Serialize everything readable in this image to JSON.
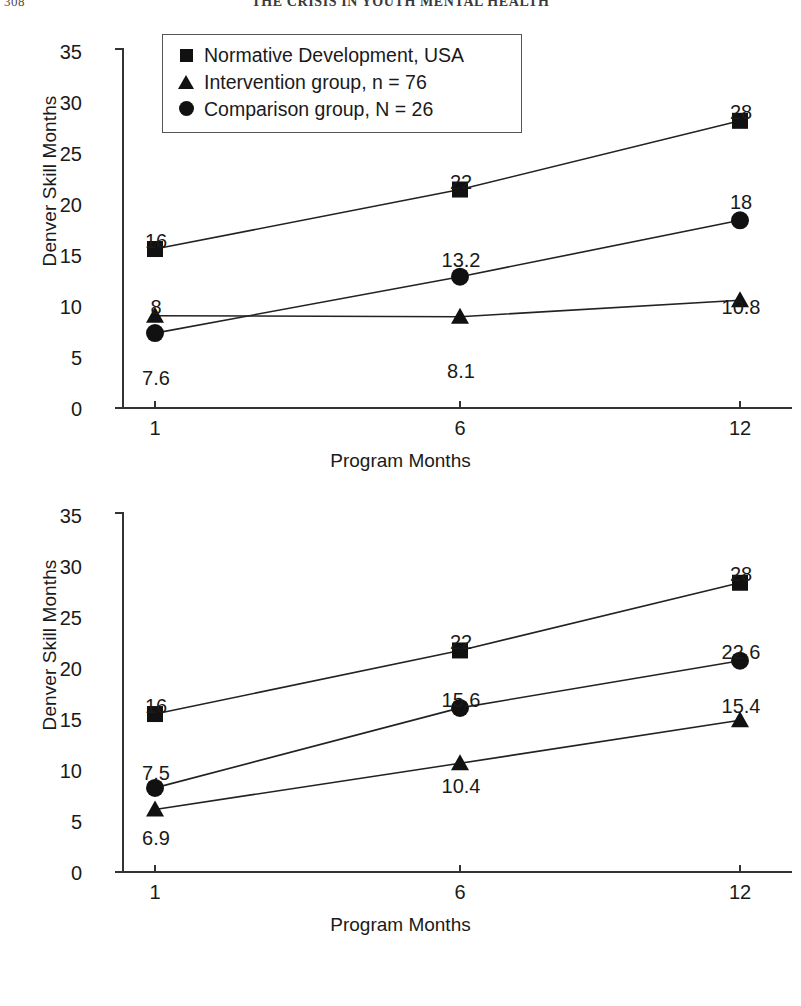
{
  "page": {
    "folio": "308",
    "running_head": "THE CRISIS IN YOUTH MENTAL HEALTH"
  },
  "legend": {
    "entries": [
      {
        "marker": "square",
        "label": "Normative Development, USA"
      },
      {
        "marker": "triangle",
        "label": "Intervention group, n = 76"
      },
      {
        "marker": "circle",
        "label": "Comparison group, N = 26"
      }
    ]
  },
  "axes": {
    "ylabel": "Denver Skill Months",
    "xlabel": "Program Months",
    "yticks": [
      "35",
      "30",
      "25",
      "20",
      "15",
      "10",
      "5",
      "0"
    ],
    "xticks": [
      "1",
      "6",
      "12"
    ]
  },
  "chart_data": [
    {
      "type": "line",
      "id": "chart-top",
      "title": "",
      "xlabel": "Program Months",
      "ylabel": "Denver Skill Months",
      "x": [
        1,
        6,
        12
      ],
      "xtick_labels": [
        "1",
        "6",
        "12"
      ],
      "ylim": [
        0,
        35
      ],
      "ytick_labels": [
        "0",
        "5",
        "10",
        "15",
        "20",
        "25",
        "30",
        "35"
      ],
      "grid": false,
      "legend_position": "top-left-inside",
      "series": [
        {
          "name": "Normative Development, USA",
          "marker": "square",
          "values": [
            15.5,
            21.3,
            28.0
          ],
          "data_labels": [
            "16",
            "22",
            "28"
          ],
          "label_positions": [
            "above",
            "above",
            "above"
          ]
        },
        {
          "name": "Intervention group, n = 76",
          "marker": "triangle",
          "values": [
            9.0,
            8.9,
            10.5
          ],
          "data_labels": [
            "8",
            "8.1",
            "10.8"
          ],
          "label_positions": [
            "above",
            "below",
            "above"
          ]
        },
        {
          "name": "Comparison group, N = 26",
          "marker": "circle",
          "values": [
            7.3,
            12.8,
            18.3
          ],
          "data_labels": [
            "7.6",
            "13.2",
            "18"
          ],
          "label_positions": [
            "below",
            "above",
            "above"
          ]
        }
      ]
    },
    {
      "type": "line",
      "id": "chart-bottom",
      "title": "",
      "xlabel": "Program Months",
      "ylabel": "Denver Skill Months",
      "x": [
        1,
        6,
        12
      ],
      "xtick_labels": [
        "1",
        "6",
        "12"
      ],
      "ylim": [
        0,
        35
      ],
      "ytick_labels": [
        "0",
        "5",
        "10",
        "15",
        "20",
        "25",
        "30",
        "35"
      ],
      "grid": false,
      "legend_position": "none",
      "series": [
        {
          "name": "Normative Development, USA",
          "marker": "square",
          "values": [
            15.4,
            21.6,
            28.2
          ],
          "data_labels": [
            "16",
            "22",
            "28"
          ],
          "label_positions": [
            "above",
            "above",
            "above"
          ]
        },
        {
          "name": "Intervention group, n = 76",
          "marker": "triangle",
          "values": [
            6.1,
            10.6,
            14.8
          ],
          "data_labels": [
            "6.9",
            "10.4",
            "15.4"
          ],
          "label_positions": [
            "below",
            "below",
            "above"
          ]
        },
        {
          "name": "Comparison group, N = 26",
          "marker": "circle",
          "values": [
            8.2,
            16.0,
            20.6
          ],
          "data_labels": [
            "7.5",
            "15.6",
            "22.6"
          ],
          "label_positions": [
            "above",
            "above",
            "above"
          ]
        }
      ]
    }
  ]
}
